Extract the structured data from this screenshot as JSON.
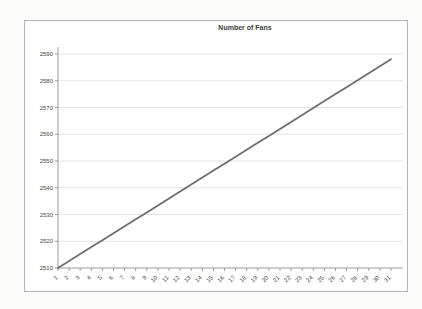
{
  "page": {
    "background": "#fcfcfb"
  },
  "panel": {
    "background": "#ffffff",
    "border_color": "#b3b3b3"
  },
  "chart_data": {
    "type": "line",
    "title": "Number of Fans",
    "x": [
      "1",
      "2",
      "3",
      "4",
      "5",
      "6",
      "7",
      "8",
      "9",
      "10",
      "11",
      "12",
      "13",
      "14",
      "15",
      "16",
      "17",
      "18",
      "19",
      "20",
      "21",
      "22",
      "23",
      "24",
      "25",
      "26",
      "27",
      "28",
      "29",
      "30",
      "31"
    ],
    "series": [
      {
        "name": "Number of Fans",
        "color": "#6e6e6e",
        "values": [
          2510,
          2512.6,
          2515.2,
          2517.8,
          2520.4,
          2523,
          2525.6,
          2528.2,
          2530.8,
          2533.4,
          2536,
          2538.6,
          2541.2,
          2543.8,
          2546.4,
          2549,
          2551.6,
          2554.2,
          2556.8,
          2559.4,
          2562,
          2564.6,
          2567.2,
          2569.8,
          2572.4,
          2575,
          2577.6,
          2580.2,
          2582.8,
          2585.4,
          2588
        ]
      }
    ],
    "xlabel": "",
    "ylabel": "",
    "ylim": [
      2510,
      2590
    ],
    "yticks": [
      2510,
      2520,
      2530,
      2540,
      2550,
      2560,
      2570,
      2580,
      2590
    ],
    "grid": true,
    "legend": false,
    "grid_color": "#e4e4e4",
    "axis_color": "#9b9b9b",
    "tick_text_color": "#474747"
  }
}
